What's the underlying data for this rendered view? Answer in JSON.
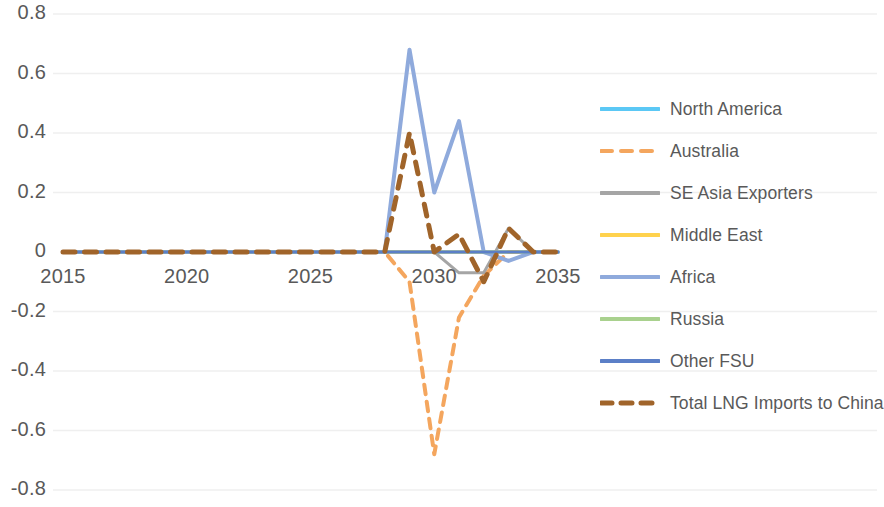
{
  "chart_data": {
    "type": "line",
    "title": "",
    "xlabel": "",
    "ylabel": "",
    "x": [
      2015,
      2016,
      2017,
      2018,
      2019,
      2020,
      2021,
      2022,
      2023,
      2024,
      2025,
      2026,
      2027,
      2028,
      2029,
      2030,
      2031,
      2032,
      2033,
      2034,
      2035
    ],
    "xlim": [
      2015,
      2035
    ],
    "ylim": [
      -0.8,
      0.8
    ],
    "x_ticks": [
      "2015",
      "2020",
      "2025",
      "2030",
      "2035"
    ],
    "x_tick_values": [
      2015,
      2020,
      2025,
      2030,
      2035
    ],
    "y_ticks": [
      "0.8",
      "0.6",
      "0.4",
      "0.2",
      "0",
      "-0.2",
      "-0.4",
      "-0.6",
      "-0.8"
    ],
    "y_tick_values": [
      0.8,
      0.6,
      0.4,
      0.2,
      0,
      -0.2,
      -0.4,
      -0.6,
      -0.8
    ],
    "grid": true,
    "legend_position": "right",
    "series": [
      {
        "name": "North America",
        "color": "#5BC8F5",
        "style": "solid",
        "width": 3,
        "values": [
          0,
          0,
          0,
          0,
          0,
          0,
          0,
          0,
          0,
          0,
          0,
          0,
          0,
          0,
          0,
          0,
          0,
          0,
          0,
          0,
          0
        ]
      },
      {
        "name": "Australia",
        "color": "#F4A65E",
        "style": "dashed",
        "width": 4,
        "values": [
          0,
          0,
          0,
          0,
          0,
          0,
          0,
          0,
          0,
          0,
          0,
          0,
          0,
          0,
          -0.1,
          -0.68,
          -0.22,
          -0.08,
          0,
          0,
          0
        ]
      },
      {
        "name": "SE Asia Exporters",
        "color": "#A5A5A5",
        "style": "solid",
        "width": 3,
        "values": [
          0,
          0,
          0,
          0,
          0,
          0,
          0,
          0,
          0,
          0,
          0,
          0,
          0,
          0,
          0,
          0,
          -0.07,
          -0.07,
          0.08,
          0,
          0
        ]
      },
      {
        "name": "Middle East",
        "color": "#FFD24D",
        "style": "solid",
        "width": 3,
        "values": [
          0,
          0,
          0,
          0,
          0,
          0,
          0,
          0,
          0,
          0,
          0,
          0,
          0,
          0,
          0,
          0,
          0,
          0,
          0,
          0,
          0
        ]
      },
      {
        "name": "Africa",
        "color": "#8FAADC",
        "style": "solid",
        "width": 4,
        "values": [
          0,
          0,
          0,
          0,
          0,
          0,
          0,
          0,
          0,
          0,
          0,
          0,
          0,
          0,
          0.68,
          0.2,
          0.44,
          0,
          -0.03,
          0,
          0
        ]
      },
      {
        "name": "Russia",
        "color": "#A9D18E",
        "style": "solid",
        "width": 3,
        "values": [
          0,
          0,
          0,
          0,
          0,
          0,
          0,
          0,
          0,
          0,
          0,
          0,
          0,
          0,
          0,
          0,
          0,
          0,
          0,
          0,
          0
        ]
      },
      {
        "name": "Other FSU",
        "color": "#5B7FC7",
        "style": "solid",
        "width": 3,
        "values": [
          0,
          0,
          0,
          0,
          0,
          0,
          0,
          0,
          0,
          0,
          0,
          0,
          0,
          0,
          0,
          0,
          0,
          0,
          0,
          0,
          0
        ]
      },
      {
        "name": "Total LNG Imports to China",
        "color": "#A0642A",
        "style": "dashed",
        "width": 5,
        "values": [
          0,
          0,
          0,
          0,
          0,
          0,
          0,
          0,
          0,
          0,
          0,
          0,
          0,
          0,
          0.4,
          0,
          0.06,
          -0.1,
          0.08,
          0,
          0
        ]
      }
    ]
  },
  "legend": {
    "items": [
      {
        "label": "North America"
      },
      {
        "label": "Australia"
      },
      {
        "label": "SE Asia Exporters"
      },
      {
        "label": "Middle East"
      },
      {
        "label": "Africa"
      },
      {
        "label": "Russia"
      },
      {
        "label": "Other FSU"
      },
      {
        "label": "Total LNG Imports to China"
      }
    ]
  }
}
